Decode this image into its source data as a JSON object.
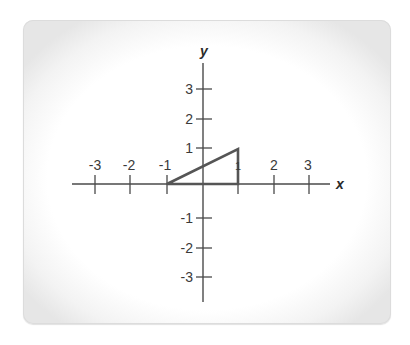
{
  "diagram": {
    "type": "coordinate-plane",
    "axes": {
      "x_label": "x",
      "y_label": "y",
      "x_ticks": [
        {
          "value": -3,
          "label": "-3"
        },
        {
          "value": -2,
          "label": "-2"
        },
        {
          "value": -1,
          "label": "-1"
        },
        {
          "value": 1,
          "label": "1"
        },
        {
          "value": 2,
          "label": "2"
        },
        {
          "value": 3,
          "label": "3"
        }
      ],
      "y_ticks": [
        {
          "value": 3,
          "label": "3"
        },
        {
          "value": 2,
          "label": "2"
        },
        {
          "value": 1,
          "label": "1"
        },
        {
          "value": -1,
          "label": "-1"
        },
        {
          "value": -2,
          "label": "-2"
        },
        {
          "value": -3,
          "label": "-3"
        }
      ],
      "x_range": [
        -3.5,
        3.5
      ],
      "y_range": [
        -3.5,
        3.5
      ]
    },
    "shapes": [
      {
        "kind": "triangle",
        "vertices": [
          [
            -1,
            0
          ],
          [
            1,
            0
          ],
          [
            1,
            1
          ]
        ],
        "stroke": "#555555"
      }
    ],
    "colors": {
      "axis": "#4a4a4a",
      "shape_stroke": "#555555",
      "text": "#3a3a3a"
    }
  }
}
